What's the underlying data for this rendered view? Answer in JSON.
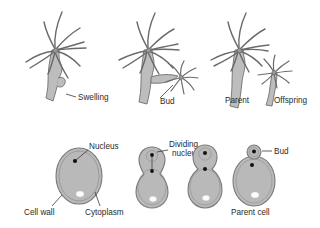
{
  "figure": {
    "background_color": "#ffffff",
    "body_fill": "#bdbdbd",
    "body_stroke": "#6e6e6e",
    "tentacle_stroke": "#6a6a6a",
    "cell_fill": "#b9b9b9",
    "cell_wall_stroke": "#7a7a7a",
    "nucleus_color": "#111111",
    "vacuole_color": "#fdfdfd",
    "label_color": "#2a2a2a"
  },
  "top_row": {
    "name": "hydra-budding-row",
    "stages": [
      {
        "id": "hydra-stage-1",
        "label": "Swelling",
        "description": "Parent hydra with a small swelling on the body column"
      },
      {
        "id": "hydra-stage-2",
        "label": "Bud",
        "description": "Swelling develops into a bud with its own tentacles"
      },
      {
        "id": "hydra-stage-3",
        "label_parent": "Parent",
        "label_offspring": "Offspring",
        "description": "Bud detaches to form an independent offspring hydra"
      }
    ]
  },
  "bottom_row": {
    "name": "yeast-budding-row",
    "labels": {
      "nucleus": "Nucleus",
      "dividing_nucleus_line1": "Dividing",
      "dividing_nucleus_line2": "nucleus",
      "bud": "Bud",
      "cell_wall": "Cell wall",
      "cytoplasm": "Cytoplasm",
      "parent_cell": "Parent cell"
    },
    "stages": [
      {
        "id": "yeast-stage-1",
        "description": "Single yeast cell showing nucleus, cytoplasm and cell wall"
      },
      {
        "id": "yeast-stage-2",
        "description": "Small bud forms at the top, nucleus begins dividing"
      },
      {
        "id": "yeast-stage-3",
        "description": "Bud enlarges, daughter nucleus moves into the bud"
      },
      {
        "id": "yeast-stage-4",
        "description": "Bud separates from the parent cell"
      }
    ]
  }
}
